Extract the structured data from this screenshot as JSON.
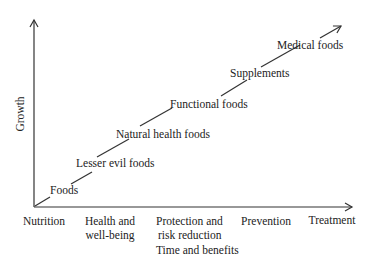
{
  "diagram": {
    "y_axis_label": "Growth",
    "x_axis_title": "Time and benefits",
    "x_categories": [
      {
        "line1": "Nutrition",
        "line2": ""
      },
      {
        "line1": "Health and",
        "line2": "well-being"
      },
      {
        "line1": "Protection and",
        "line2": "risk reduction"
      },
      {
        "line1": "Prevention",
        "line2": ""
      },
      {
        "line1": "Treatment",
        "line2": ""
      }
    ],
    "progression": [
      "Foods",
      "Lesser evil foods",
      "Natural health foods",
      "Functional foods",
      "Supplements",
      "Medical foods"
    ],
    "colors": {
      "line": "#333333",
      "text": "#222222",
      "background": "#ffffff"
    }
  }
}
